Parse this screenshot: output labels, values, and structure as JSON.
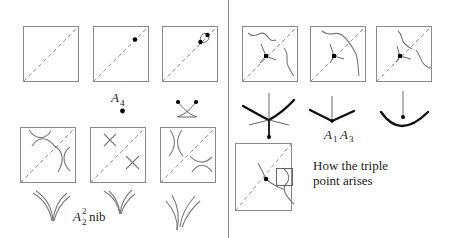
{
  "figure": {
    "left_panel": {
      "top_row": [
        {
          "id": "diagonal-only",
          "marks": "empty square with dashed diagonal"
        },
        {
          "id": "a4-point",
          "marks": "single dot on diagonal"
        },
        {
          "id": "a4-split",
          "marks": "two dots joined by a small loop across diagonal"
        }
      ],
      "a4_label": {
        "base": "A",
        "sub": "4"
      },
      "bottom_row": [
        {
          "id": "hyperbolas-pre",
          "marks": "two pairs of hyperbola arcs"
        },
        {
          "id": "crossing",
          "marks": "two X crossings"
        },
        {
          "id": "hyperbolas-post",
          "marks": "two pairs of hyperbola arcs rotated"
        }
      ],
      "nib_label": {
        "base": "A",
        "sup": "2",
        "sub": "2",
        "text": "nib"
      }
    },
    "right_panel": {
      "top_row": [
        {
          "id": "triple-point-a",
          "marks": "triple point with two wavy curves"
        },
        {
          "id": "triple-point-b",
          "marks": "triple point with two wavy curves"
        },
        {
          "id": "triple-point-c",
          "marks": "triple point with two wavy curves"
        }
      ],
      "a1a3_label": {
        "a1_base": "A",
        "a1_sub": "1",
        "a3_base": "A",
        "a3_sub": "3"
      },
      "caption_line1": "How the triple",
      "caption_line2": "point arises"
    }
  }
}
